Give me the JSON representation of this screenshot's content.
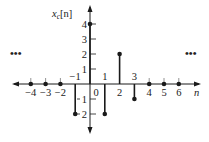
{
  "chart_data": {
    "type": "stem",
    "title": "",
    "ylabel": "x_c[n]",
    "ylabel_base": "x",
    "ylabel_sub": "c",
    "ylabel_arg": "[n]",
    "xlabel": "n",
    "x": [
      -4,
      -3,
      -2,
      -1,
      0,
      1,
      2,
      3,
      4,
      5,
      6
    ],
    "values": [
      0,
      0,
      0,
      -2,
      4,
      -2,
      2,
      -1,
      0,
      0,
      0
    ],
    "x_tick_labels": [
      {
        "n": -4,
        "label": "−4",
        "pos": "below"
      },
      {
        "n": -3,
        "label": "−3",
        "pos": "below"
      },
      {
        "n": -2,
        "label": "−2",
        "pos": "below"
      },
      {
        "n": -1,
        "label": "−1",
        "pos": "above"
      },
      {
        "n": 0,
        "label": "0",
        "pos": "below"
      },
      {
        "n": 1,
        "label": "1",
        "pos": "above"
      },
      {
        "n": 2,
        "label": "2",
        "pos": "below"
      },
      {
        "n": 3,
        "label": "3",
        "pos": "above"
      },
      {
        "n": 4,
        "label": "4",
        "pos": "below"
      },
      {
        "n": 5,
        "label": "5",
        "pos": "below"
      },
      {
        "n": 6,
        "label": "6",
        "pos": "below"
      }
    ],
    "y_ticks": [
      4,
      3,
      2,
      1,
      -1,
      -2
    ],
    "y_tick_labels": [
      "4",
      "3",
      "2",
      "1",
      "1",
      "2"
    ],
    "xlim": [
      -5.3,
      7.3
    ],
    "ylim": [
      -3.3,
      5.3
    ],
    "continuation_marks": {
      "left": "•••",
      "right": "•••"
    },
    "grid": false,
    "legend": "none"
  }
}
